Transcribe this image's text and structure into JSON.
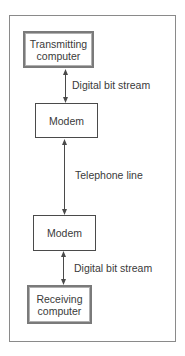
{
  "diagram": {
    "type": "flowchart-vertical",
    "nodes": [
      {
        "id": "transmitting-computer",
        "label": "Transmitting\ncomputer",
        "style": "thick-border"
      },
      {
        "id": "modem-1",
        "label": "Modem",
        "style": "thin-border"
      },
      {
        "id": "modem-2",
        "label": "Modem",
        "style": "thin-border"
      },
      {
        "id": "receiving-computer",
        "label": "Receiving\ncomputer",
        "style": "thick-border"
      }
    ],
    "edges": [
      {
        "from": "transmitting-computer",
        "to": "modem-1",
        "label": "Digital bit stream",
        "direction": "bidirectional"
      },
      {
        "from": "modem-1",
        "to": "modem-2",
        "label": "Telephone line",
        "direction": "bidirectional"
      },
      {
        "from": "modem-2",
        "to": "receiving-computer",
        "label": "Digital bit stream",
        "direction": "bidirectional"
      }
    ],
    "colors": {
      "line": "#4a4a4a",
      "frame": "#8a8a8a",
      "text": "#3a3a3a",
      "background": "#ffffff"
    }
  }
}
